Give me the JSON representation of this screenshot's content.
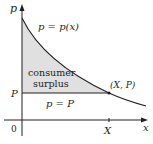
{
  "diagram": {
    "type": "economics-consumer-surplus",
    "axes": {
      "y_label": "p",
      "x_label": "x",
      "origin_label": "0",
      "y_tick_label": "P",
      "x_tick_label": "X"
    },
    "curve_label": "p = p(x)",
    "horizontal_line_label": "p = P",
    "point_label": "(X, P)",
    "region_label_line1": "consumer",
    "region_label_line2": "surplus",
    "colors": {
      "axis": "#231f20",
      "curve": "#231f20",
      "region_fill": "#e0e0e0"
    }
  }
}
